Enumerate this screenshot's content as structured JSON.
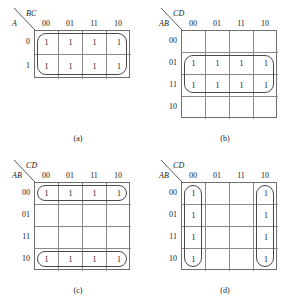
{
  "figure": {
    "background_color": "#ffffff",
    "line_color": "#6e6e6e",
    "text_color": "#1a1a1a",
    "loop_color": "#4a4a4a"
  },
  "maps": [
    {
      "id": "a",
      "caption": "(a)",
      "row_variable": "A",
      "col_variable": "BC",
      "col_headers": [
        "00",
        "01",
        "11",
        "10"
      ],
      "row_headers": [
        "0",
        "1"
      ],
      "cells": [
        [
          "1",
          "1",
          "1",
          "1"
        ],
        [
          "1",
          "1",
          "1",
          "1"
        ]
      ],
      "groups": [
        {
          "name": "group-all-ones",
          "row": 0,
          "col": 0,
          "rowspan": 2,
          "colspan": 4
        }
      ]
    },
    {
      "id": "b",
      "caption": "(b)",
      "row_variable": "AB",
      "col_variable": "CD",
      "col_headers": [
        "00",
        "01",
        "11",
        "10"
      ],
      "row_headers": [
        "00",
        "01",
        "11",
        "10"
      ],
      "cells": [
        [
          "",
          "",
          "",
          ""
        ],
        [
          "1",
          "1",
          "1",
          "1"
        ],
        [
          "1",
          "1",
          "1",
          "1"
        ],
        [
          "",
          "",
          "",
          ""
        ]
      ],
      "groups": [
        {
          "name": "group-rows-01-11",
          "row": 1,
          "col": 0,
          "rowspan": 2,
          "colspan": 4
        }
      ]
    },
    {
      "id": "c",
      "caption": "(c)",
      "row_variable": "AB",
      "col_variable": "CD",
      "col_headers": [
        "00",
        "01",
        "11",
        "10"
      ],
      "row_headers": [
        "00",
        "01",
        "11",
        "10"
      ],
      "cells": [
        [
          "1",
          "1",
          "1",
          "1"
        ],
        [
          "",
          "",
          "",
          ""
        ],
        [
          "",
          "",
          "",
          ""
        ],
        [
          "1",
          "1",
          "1",
          "1"
        ]
      ],
      "groups": [
        {
          "name": "group-row-00",
          "row": 0,
          "col": 0,
          "rowspan": 1,
          "colspan": 4
        },
        {
          "name": "group-row-10",
          "row": 3,
          "col": 0,
          "rowspan": 1,
          "colspan": 4
        }
      ]
    },
    {
      "id": "d",
      "caption": "(d)",
      "row_variable": "AB",
      "col_variable": "CD",
      "col_headers": [
        "00",
        "01",
        "11",
        "10"
      ],
      "row_headers": [
        "00",
        "01",
        "11",
        "10"
      ],
      "cells": [
        [
          "1",
          "",
          "",
          "1"
        ],
        [
          "1",
          "",
          "",
          "1"
        ],
        [
          "1",
          "",
          "",
          "1"
        ],
        [
          "1",
          "",
          "",
          "1"
        ]
      ],
      "groups": [
        {
          "name": "group-col-00",
          "row": 0,
          "col": 0,
          "rowspan": 4,
          "colspan": 1
        },
        {
          "name": "group-col-10",
          "row": 0,
          "col": 3,
          "rowspan": 4,
          "colspan": 1
        }
      ]
    }
  ]
}
